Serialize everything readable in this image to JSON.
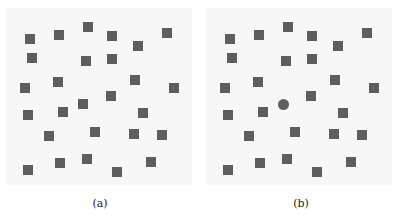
{
  "panels": [
    {
      "caption": "(a)",
      "squares": [
        [
          30,
          39
        ],
        [
          59,
          35
        ],
        [
          88,
          27
        ],
        [
          112,
          36
        ],
        [
          138,
          46
        ],
        [
          167,
          33
        ],
        [
          32,
          58
        ],
        [
          86,
          61
        ],
        [
          112,
          59
        ],
        [
          25,
          88
        ],
        [
          58,
          82
        ],
        [
          135,
          80
        ],
        [
          174,
          88
        ],
        [
          111,
          96
        ],
        [
          83,
          104
        ],
        [
          28,
          115
        ],
        [
          63,
          112
        ],
        [
          143,
          113
        ],
        [
          49,
          136
        ],
        [
          95,
          132
        ],
        [
          134,
          134
        ],
        [
          162,
          135
        ],
        [
          60,
          163
        ],
        [
          87,
          159
        ],
        [
          151,
          162
        ],
        [
          28,
          170
        ],
        [
          117,
          172
        ]
      ],
      "circles": []
    },
    {
      "caption": "(b)",
      "squares": [
        [
          30,
          39
        ],
        [
          59,
          35
        ],
        [
          88,
          27
        ],
        [
          112,
          36
        ],
        [
          138,
          46
        ],
        [
          167,
          33
        ],
        [
          32,
          58
        ],
        [
          86,
          61
        ],
        [
          112,
          59
        ],
        [
          25,
          88
        ],
        [
          58,
          82
        ],
        [
          135,
          80
        ],
        [
          174,
          88
        ],
        [
          111,
          96
        ],
        [
          28,
          115
        ],
        [
          63,
          112
        ],
        [
          143,
          113
        ],
        [
          49,
          136
        ],
        [
          95,
          132
        ],
        [
          134,
          134
        ],
        [
          162,
          135
        ],
        [
          60,
          163
        ],
        [
          87,
          159
        ],
        [
          151,
          162
        ],
        [
          28,
          170
        ],
        [
          117,
          172
        ]
      ],
      "circles": [
        [
          83,
          104
        ]
      ]
    }
  ],
  "colors": {
    "marker": "#5e5e5e",
    "panel_bg": "#f7f7f7"
  }
}
